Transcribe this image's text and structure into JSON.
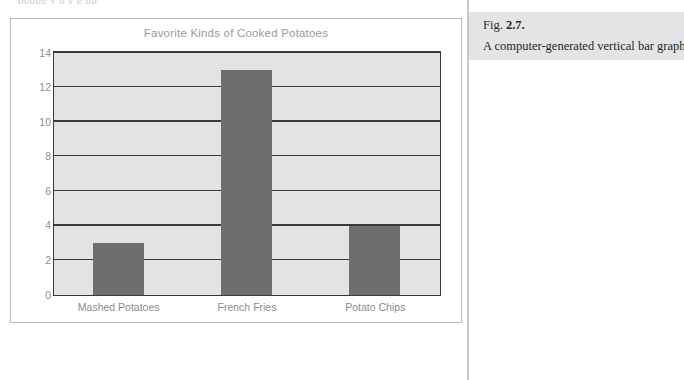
{
  "top_bleed_text": "ppppg y p y g pp",
  "figure": {
    "chart_title": "Favorite Kinds of Cooked Potatoes"
  },
  "caption": {
    "fig_prefix": "Fig.",
    "fig_number": "2.7.",
    "text": "A computer-generated vertical bar graph"
  },
  "colors": {
    "bar_fill": "#6e6e6e",
    "plot_background": "#e3e3e3",
    "plot_border": "#3a3a3a",
    "gridline": "#3a3a3a",
    "tick_label": "#8e8e8e",
    "title": "#9a9a9a",
    "caption_background": "#e4e4e4",
    "divider": "#c6c6cb",
    "figure_border": "#b9b9bd"
  },
  "chart_data": {
    "type": "bar",
    "title": "Favorite Kinds of Cooked Potatoes",
    "xlabel": "",
    "ylabel": "",
    "categories": [
      "Mashed Potatoes",
      "French Fries",
      "Potato Chips"
    ],
    "values": [
      3,
      13,
      4
    ],
    "ylim": [
      0,
      14
    ],
    "yticks": [
      0,
      2,
      4,
      6,
      8,
      10,
      12,
      14
    ],
    "ytick_labels": [
      "0",
      "2",
      "4",
      "6",
      "8",
      "10",
      "12",
      "14"
    ],
    "grid": true,
    "grid_axis": "y",
    "legend": false,
    "legend_position": "none",
    "orientation": "vertical",
    "bar_color": "#6e6e6e"
  }
}
